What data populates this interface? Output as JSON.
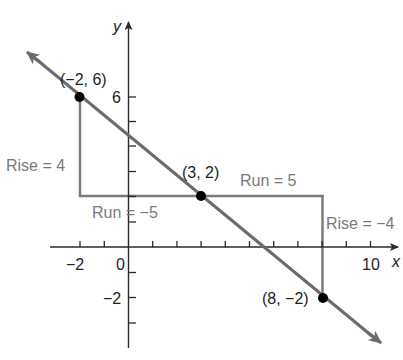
{
  "diagram": {
    "type": "coordinate-plane-slope",
    "axes": {
      "x_label": "x",
      "y_label": "y",
      "x_tick_labels": [
        {
          "value": -2,
          "text": "−2"
        },
        {
          "value": 0,
          "text": "0"
        },
        {
          "value": 10,
          "text": "10"
        }
      ],
      "y_tick_labels": [
        {
          "value": 6,
          "text": "6"
        },
        {
          "value": -2,
          "text": "−2"
        }
      ],
      "x_range": [
        -2,
        10
      ],
      "y_range": [
        -4,
        9
      ],
      "tick_step": 1
    },
    "line": {
      "description": "line through (−2, 6), (3, 2), (8, −2)",
      "color": "#6b6b6b"
    },
    "points": [
      {
        "x": -2,
        "y": 6,
        "label": "(−2, 6)"
      },
      {
        "x": 3,
        "y": 2,
        "label": "(3, 2)"
      },
      {
        "x": 8,
        "y": -2,
        "label": "(8, −2)"
      }
    ],
    "annotations": {
      "rise_left": "Rise = 4",
      "run_left": "Run = −5",
      "run_right": "Run = 5",
      "rise_right": "Rise = −4"
    },
    "colors": {
      "axis": "#2a2a2a",
      "guide": "#7a7a7a",
      "label_gray": "#7a7a7a",
      "label_dark": "#1e1e1e",
      "point": "#000000"
    }
  }
}
